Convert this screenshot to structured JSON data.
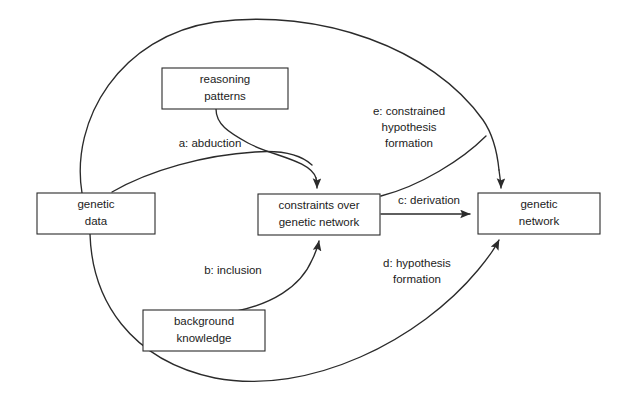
{
  "diagram": {
    "background_color": "#ffffff",
    "line_color": "#2b2b2b",
    "text_color": "#1c1c1c",
    "nodes": [
      {
        "id": "reasoning-patterns",
        "line1": "reasoning",
        "line2": "patterns",
        "x": 162,
        "y": 68,
        "w": 126,
        "h": 41
      },
      {
        "id": "genetic-data",
        "line1": "genetic",
        "line2": "data",
        "x": 37,
        "y": 193,
        "w": 118,
        "h": 41
      },
      {
        "id": "constraints-over-genetic-network",
        "line1": "constraints over",
        "line2": "genetic network",
        "x": 258,
        "y": 194,
        "w": 122,
        "h": 41
      },
      {
        "id": "genetic-network",
        "line1": "genetic",
        "line2": "network",
        "x": 478,
        "y": 193,
        "w": 122,
        "h": 41
      },
      {
        "id": "background-knowledge",
        "line1": "background",
        "line2": "knowledge",
        "x": 143,
        "y": 310,
        "w": 122,
        "h": 41
      }
    ],
    "edges": [
      {
        "id": "a-abduction",
        "label_lines": [
          "a: abduction"
        ],
        "label_x": 210,
        "label_y": 144,
        "from": "genetic-data",
        "to": "constraints-over-genetic-network"
      },
      {
        "id": "b-inclusion",
        "label_lines": [
          "b: inclusion"
        ],
        "label_x": 233,
        "label_y": 271,
        "from": "background-knowledge",
        "to": "constraints-over-genetic-network"
      },
      {
        "id": "c-derivation",
        "label_lines": [
          "c: derivation"
        ],
        "label_x": 429,
        "label_y": 201,
        "from": "constraints-over-genetic-network",
        "to": "genetic-network"
      },
      {
        "id": "d-hypothesis-formation",
        "label_lines": [
          "d: hypothesis",
          "formation"
        ],
        "label_x": 417,
        "label_y": 270,
        "from": "genetic-data",
        "to": "genetic-network"
      },
      {
        "id": "e-constrained-hypothesis-formation",
        "label_lines": [
          "e: constrained",
          "hypothesis",
          "formation"
        ],
        "label_x": 409,
        "label_y": 112,
        "from": "reasoning-patterns",
        "to": "genetic-network"
      }
    ]
  }
}
